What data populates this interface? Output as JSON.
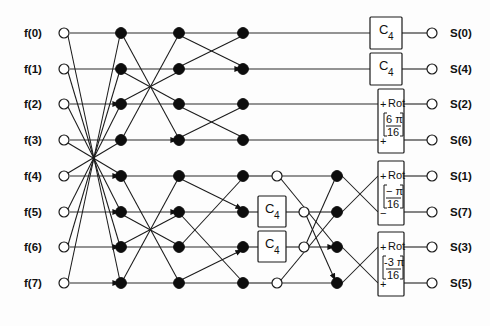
{
  "diagram": {
    "type": "butterfly-flow-graph",
    "width": 490,
    "height": 326,
    "colors": {
      "background": "#ffffff",
      "line": "#1a1a1a",
      "node_filled": "#0d0d0d",
      "node_open": "#ffffff"
    },
    "inputs": [
      {
        "id": "f0",
        "label": "f(0)",
        "row": 0
      },
      {
        "id": "f1",
        "label": "f(1)",
        "row": 1
      },
      {
        "id": "f2",
        "label": "f(2)",
        "row": 2
      },
      {
        "id": "f3",
        "label": "f(3)",
        "row": 3
      },
      {
        "id": "f4",
        "label": "f(4)",
        "row": 4
      },
      {
        "id": "f5",
        "label": "f(5)",
        "row": 5
      },
      {
        "id": "f6",
        "label": "f(6)",
        "row": 6
      },
      {
        "id": "f7",
        "label": "f(7)",
        "row": 7
      }
    ],
    "outputs": [
      {
        "id": "s0",
        "label": "S(0)",
        "row": 0
      },
      {
        "id": "s4",
        "label": "S(4)",
        "row": 1
      },
      {
        "id": "s2",
        "label": "S(2)",
        "row": 2
      },
      {
        "id": "s6",
        "label": "S(6)",
        "row": 3
      },
      {
        "id": "s1",
        "label": "S(1)",
        "row": 4
      },
      {
        "id": "s7",
        "label": "S(7)",
        "row": 5
      },
      {
        "id": "s3",
        "label": "S(3)",
        "row": 6
      },
      {
        "id": "s5",
        "label": "S(5)",
        "row": 7
      }
    ],
    "blocks": [
      {
        "id": "c4-a",
        "kind": "C4",
        "main": "C",
        "sub": "4",
        "rows": [
          0
        ]
      },
      {
        "id": "c4-b",
        "kind": "C4",
        "main": "C",
        "sub": "4",
        "rows": [
          1
        ]
      },
      {
        "id": "c4-c",
        "kind": "C4",
        "main": "C",
        "sub": "4",
        "rows": [
          5
        ]
      },
      {
        "id": "c4-d",
        "kind": "C4",
        "main": "C",
        "sub": "4",
        "rows": [
          6
        ]
      },
      {
        "id": "rot-a",
        "kind": "Rot",
        "label": "Rot",
        "numerator": "6 π",
        "denominator": "16",
        "top_sign": "+",
        "bottom_sign": "+",
        "rows": [
          2,
          3
        ]
      },
      {
        "id": "rot-b",
        "kind": "Rot",
        "label": "Rot",
        "numerator": "− π",
        "denominator": "16",
        "top_sign": "+",
        "bottom_sign": "−",
        "rows": [
          4,
          5
        ]
      },
      {
        "id": "rot-c",
        "kind": "Rot",
        "label": "Rot",
        "numerator": "-3 π",
        "denominator": "16",
        "top_sign": "+",
        "bottom_sign": "+",
        "rows": [
          6,
          7
        ]
      }
    ],
    "stages": [
      {
        "index": 1,
        "x": 121,
        "node_type": "filled",
        "count": 8
      },
      {
        "index": 2,
        "x": 179,
        "node_type": "filled",
        "count": 8
      },
      {
        "index": 3,
        "x": 243,
        "node_type": "mixed",
        "count": 8
      }
    ],
    "row_y": [
      33,
      69,
      104,
      140,
      176,
      212,
      247,
      283
    ]
  }
}
